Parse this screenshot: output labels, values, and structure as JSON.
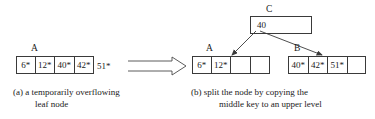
{
  "figure": {
    "background_color": "#ffffff",
    "line_color": "#3a3a3a",
    "text_color": "#1a1a1a"
  },
  "panel_a": {
    "node_label": "A",
    "node_name": "leaf-node-a-overflowing",
    "keys": [
      "6*",
      "12*",
      "40*",
      "42*"
    ],
    "overflow_key": "51*",
    "caption_line1": "(a) a temporarily overflowing",
    "caption_line2": "leaf node"
  },
  "transition": {
    "arrow_name": "big-implication-arrow",
    "arrow_style": "hollow-double-line-right-arrow"
  },
  "panel_b": {
    "parent": {
      "label": "C",
      "keys": [
        "40"
      ]
    },
    "left_leaf": {
      "label": "A",
      "keys": [
        "6*",
        "12*",
        "",
        ""
      ]
    },
    "right_leaf": {
      "label": "B",
      "keys": [
        "40*",
        "42*",
        "51*",
        ""
      ]
    },
    "pointer_left_name": "pointer-c-to-a",
    "pointer_right_name": "pointer-c-to-b",
    "caption_line1": "(b) split the node by copying the",
    "caption_line2": "middle key to an upper level"
  }
}
